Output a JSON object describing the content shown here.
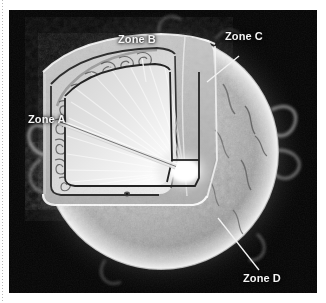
{
  "figure": {
    "background_color": "#050505",
    "labels": [
      {
        "id": "zone-a",
        "text": "Zone A",
        "pointer": "long thin double-line pointer from label to bright core",
        "target": "bright core at center of cutaway"
      },
      {
        "id": "zone-b",
        "text": "Zone B",
        "pointer": "short diagonal leader line down-right",
        "target": "outer arc edge of cutaway wedge with convection cells"
      },
      {
        "id": "zone-c",
        "text": "Zone C",
        "pointer": "short diagonal leader line down-left",
        "target": "upper-right surface shell of the sphere"
      },
      {
        "id": "zone-d",
        "text": "Zone D",
        "pointer": "long diagonal leader line up-left",
        "target": "lower flat cut face of the removed octant"
      }
    ],
    "features": {
      "sphere": "bright mottled photospheric surface with granulation",
      "core": "intense white radiating core at the wedge apex",
      "convection_cells": "row of curled convection plumes along the cutaway arc",
      "sunspots": "two small dark sunspots on the cut faces",
      "prominences": "wispy plasma prominences around the limb"
    },
    "colors": {
      "background": "#050505",
      "label_text": "#f4f4f4",
      "leader_line": "#f0f0f0",
      "core_glow": "#ffffff",
      "surface": "#b9b9b9",
      "margin_rule": "#b8b8b8"
    }
  }
}
